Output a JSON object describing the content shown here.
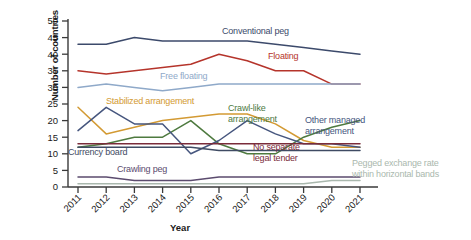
{
  "chart_data": {
    "type": "line",
    "title": "",
    "xlabel": "Year",
    "ylabel": "Number of countries",
    "x": [
      2011,
      2012,
      2013,
      2014,
      2015,
      2016,
      2017,
      2018,
      2019,
      2020,
      2021
    ],
    "xticklabels": [
      "2011",
      "2012",
      "2013",
      "2014",
      "2015",
      "2016",
      "2017",
      "2018",
      "2019",
      "2020",
      "2021"
    ],
    "yticklabels": [
      "0",
      "5",
      "10",
      "15",
      "20",
      "25",
      "30",
      "35",
      "40",
      "45",
      "50"
    ],
    "ylim": [
      0,
      50
    ],
    "ytick_step": 5,
    "grid": false,
    "legend": "inline-labels",
    "series": [
      {
        "name": "Conventional peg",
        "color": "#3c4a6b",
        "values": [
          43,
          43,
          45,
          44,
          44,
          44,
          44,
          43,
          42,
          41,
          40
        ],
        "label_x": 222,
        "label_y": 26
      },
      {
        "name": "Floating",
        "color": "#b5342b",
        "values": [
          35,
          34,
          35,
          36,
          37,
          40,
          38,
          35,
          35,
          31,
          31
        ],
        "label_x": 268,
        "label_y": 51
      },
      {
        "name": "Free floating",
        "color": "#8fa9c9",
        "values": [
          30,
          31,
          30,
          29,
          30,
          31,
          31,
          31,
          31,
          31,
          31
        ],
        "label_x": 160,
        "label_y": 71
      },
      {
        "name": "Stabilized arrangement",
        "color": "#d39a33",
        "values": [
          24,
          16,
          18,
          20,
          21,
          22,
          22,
          19,
          14,
          12,
          12
        ],
        "label_x": 106,
        "label_y": 96
      },
      {
        "name": "Crawl-like arrangement",
        "color": "#4e7a3f",
        "values": [
          12,
          13,
          15,
          15,
          20,
          13,
          10,
          10,
          15,
          18,
          20
        ],
        "label_x": 228,
        "label_y": 103
      },
      {
        "name": "Other managed arrangement",
        "color": "#46567e",
        "values": [
          17,
          24,
          19,
          19,
          10,
          14,
          20,
          16,
          13,
          13,
          12
        ],
        "label_x": 305,
        "label_y": 115
      },
      {
        "name": "No separate legal tender",
        "color": "#7a2c3a",
        "values": [
          13,
          13,
          13,
          13,
          13,
          13,
          13,
          13,
          13,
          13,
          13
        ],
        "label_x": 253,
        "label_y": 142
      },
      {
        "name": "Currency board",
        "color": "#3f4b63",
        "values": [
          12,
          12,
          12,
          12,
          12,
          11,
          11,
          11,
          11,
          11,
          11
        ],
        "label_x": 68,
        "label_y": 147
      },
      {
        "name": "Crawling peg",
        "color": "#5b4b6e",
        "values": [
          3,
          3,
          2,
          2,
          2,
          3,
          3,
          3,
          3,
          3,
          3
        ],
        "label_x": 117,
        "label_y": 164
      },
      {
        "name": "Pegged exchange rate within horizontal bands",
        "color": "#aab8ae",
        "values": [
          1,
          1,
          1,
          1,
          1,
          1,
          1,
          1,
          1,
          2,
          2
        ],
        "label_x": 352,
        "label_y": 158
      }
    ]
  }
}
